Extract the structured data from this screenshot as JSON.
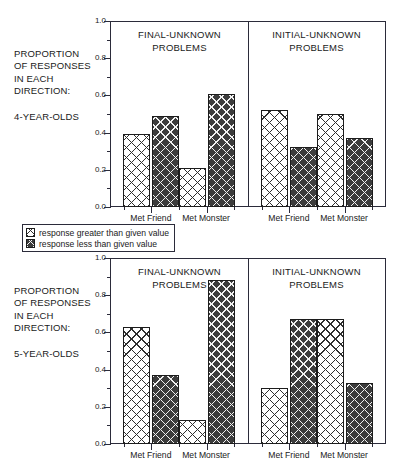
{
  "figure": {
    "axis_caption_lines": [
      "PROPORTION",
      "OF RESPONSES",
      "IN EACH",
      "DIRECTION:"
    ],
    "legend": {
      "items": [
        {
          "key": "greater",
          "label": "response greater than given value",
          "swatch": "light-crosshatch-swatch"
        },
        {
          "key": "less",
          "label": "response less than given value",
          "swatch": "dark-crosshatch-swatch"
        }
      ]
    }
  },
  "chart_data": [
    {
      "type": "bar",
      "title": "",
      "panel_id": "4-year-olds",
      "age_group": "4-YEAR-OLDS",
      "ylabel": "PROPORTION OF RESPONSES IN EACH DIRECTION:",
      "xlabel": "",
      "ylim": [
        0.0,
        1.0
      ],
      "yticks": [
        0.0,
        0.2,
        0.4,
        0.6,
        0.8,
        1.0
      ],
      "ytick_labels": [
        "0.0",
        "0.2",
        "0.4",
        "0.6",
        "0.8",
        "1.0"
      ],
      "minor_yticks": [
        0.1,
        0.3,
        0.5,
        0.7,
        0.9
      ],
      "grid": false,
      "legend_position": "below-figure",
      "subpanels": [
        {
          "title": "FINAL-UNKNOWN PROBLEMS",
          "title_lines": [
            "FINAL-UNKNOWN",
            "PROBLEMS"
          ],
          "categories": [
            "Met Friend",
            "Met Monster"
          ],
          "series": [
            {
              "name": "response greater than given value",
              "values": [
                0.39,
                0.21
              ]
            },
            {
              "name": "response less than given value",
              "values": [
                0.49,
                0.61
              ]
            }
          ]
        },
        {
          "title": "INITIAL-UNKNOWN PROBLEMS",
          "title_lines": [
            "INITIAL-UNKNOWN",
            "PROBLEMS"
          ],
          "categories": [
            "Met Friend",
            "Met Monster"
          ],
          "series": [
            {
              "name": "response greater than given value",
              "values": [
                0.52,
                0.5
              ]
            },
            {
              "name": "response less than given value",
              "values": [
                0.32,
                0.37
              ]
            }
          ]
        }
      ]
    },
    {
      "type": "bar",
      "title": "",
      "panel_id": "5-year-olds",
      "age_group": "5-YEAR-OLDS",
      "ylabel": "PROPORTION OF RESPONSES IN EACH DIRECTION:",
      "xlabel": "",
      "ylim": [
        0.0,
        1.0
      ],
      "yticks": [
        0.0,
        0.2,
        0.4,
        0.6,
        0.8,
        1.0
      ],
      "ytick_labels": [
        "0.0",
        "0.2",
        "0.4",
        "0.6",
        "0.8",
        "1.0"
      ],
      "minor_yticks": [
        0.1,
        0.3,
        0.5,
        0.7,
        0.9
      ],
      "grid": false,
      "legend_position": "above-figure",
      "subpanels": [
        {
          "title": "FINAL-UNKNOWN PROBLEMS",
          "title_lines": [
            "FINAL-UNKNOWN",
            "PROBLEMS"
          ],
          "categories": [
            "Met Friend",
            "Met Monster"
          ],
          "series": [
            {
              "name": "response greater than given value",
              "values": [
                0.63,
                0.13
              ]
            },
            {
              "name": "response less than given value",
              "values": [
                0.37,
                0.88
              ]
            }
          ]
        },
        {
          "title": "INITIAL-UNKNOWN PROBLEMS",
          "title_lines": [
            "INITIAL-UNKNOWN",
            "PROBLEMS"
          ],
          "categories": [
            "Met Friend",
            "Met Monster"
          ],
          "series": [
            {
              "name": "response greater than given value",
              "values": [
                0.3,
                0.67
              ]
            },
            {
              "name": "response less than given value",
              "values": [
                0.67,
                0.33
              ]
            }
          ]
        }
      ]
    }
  ],
  "colors": {
    "axis": "#2b2b3a",
    "bar_light_ground": "#ffffff",
    "bar_light_hatch": "#2e2e2e",
    "bar_dark_ground": "#3c3c3c",
    "bar_dark_hatch": "#f2f2f2",
    "text": "#1a1a1a"
  }
}
